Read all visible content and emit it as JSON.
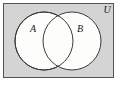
{
  "figure": {
    "type": "venn-diagram",
    "universe": {
      "label": "U",
      "label_x": 107,
      "label_y": 12,
      "fill": "#d4d4d4",
      "stroke": "#555555",
      "rect": {
        "x": 3,
        "y": 3,
        "width": 111,
        "height": 75
      }
    },
    "sets": [
      {
        "label": "A",
        "label_x": 33,
        "label_y": 32,
        "cx": 44,
        "cy": 41,
        "r": 29,
        "fill": "#fdfdfb",
        "stroke": "#3a3a3a"
      },
      {
        "label": "B",
        "label_x": 80,
        "label_y": 32,
        "cx": 72,
        "cy": 41,
        "r": 29,
        "fill": "#fdfdfb",
        "stroke": "#3a3a3a"
      }
    ],
    "colors": {
      "page_background": "#ffffff",
      "universe_fill": "#d4d4d4",
      "universe_border": "#555555",
      "circle_fill": "#fdfdfb",
      "circle_border": "#3a3a3a",
      "text": "#1a1a1a"
    }
  }
}
